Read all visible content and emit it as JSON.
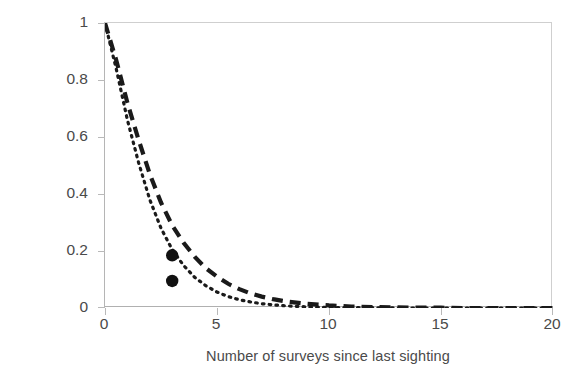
{
  "chart_data": {
    "type": "line",
    "title": "",
    "subtitle": "",
    "xlabel": "Number of surveys since last sighting",
    "ylabel": "Probability bottleweed present",
    "xlim": [
      0,
      20
    ],
    "ylim": [
      0,
      1
    ],
    "xticks": [
      "0",
      "5",
      "10",
      "15",
      "20"
    ],
    "xtick_values": [
      0,
      5,
      10,
      15,
      20
    ],
    "yticks": [
      "0",
      "0.2",
      "0.4",
      "0.6",
      "0.8",
      "1"
    ],
    "ytick_values": [
      0,
      0.2,
      0.4,
      0.6,
      0.8,
      1
    ],
    "grid": false,
    "legend": "none",
    "series": [
      {
        "name": "dashed-curve",
        "style": "dashed",
        "color": "#1a1a1a",
        "x": [
          0,
          0.5,
          1,
          1.5,
          2,
          2.5,
          3,
          3.5,
          4,
          4.5,
          5,
          5.5,
          6,
          6.5,
          7,
          7.5,
          8,
          9,
          10,
          11,
          12,
          13,
          14,
          15,
          16,
          17,
          18,
          19,
          20
        ],
        "values": [
          1.0,
          0.87,
          0.72,
          0.59,
          0.47,
          0.37,
          0.29,
          0.23,
          0.18,
          0.14,
          0.11,
          0.085,
          0.066,
          0.051,
          0.04,
          0.031,
          0.024,
          0.015,
          0.009,
          0.005,
          0.003,
          0.002,
          0.001,
          0.001,
          0.0,
          0.0,
          0.0,
          0.0,
          0.0
        ]
      },
      {
        "name": "dotted-curve",
        "style": "dotted",
        "color": "#1a1a1a",
        "x": [
          0,
          0.5,
          1,
          1.5,
          2,
          2.5,
          3,
          3.5,
          4,
          4.5,
          5,
          5.5,
          6,
          6.5,
          7,
          7.5,
          8,
          9,
          10,
          11,
          12,
          13,
          14,
          15,
          16,
          17,
          18,
          19,
          20
        ],
        "values": [
          1.0,
          0.84,
          0.66,
          0.51,
          0.38,
          0.28,
          0.205,
          0.15,
          0.108,
          0.078,
          0.056,
          0.04,
          0.029,
          0.021,
          0.015,
          0.011,
          0.008,
          0.004,
          0.002,
          0.001,
          0.001,
          0.0,
          0.0,
          0.0,
          0.0,
          0.0,
          0.0,
          0.0,
          0.0
        ]
      }
    ],
    "markers": [
      {
        "name": "marker-upper",
        "x": 3,
        "y": 0.185,
        "shape": "circle",
        "color": "#111111"
      },
      {
        "name": "marker-lower",
        "x": 3,
        "y": 0.095,
        "shape": "circle",
        "color": "#111111"
      }
    ],
    "colors": {
      "axis": "#b9b9b9",
      "frame": "#cfcfcf",
      "text": "#4a4a4a",
      "curve": "#1a1a1a"
    }
  }
}
